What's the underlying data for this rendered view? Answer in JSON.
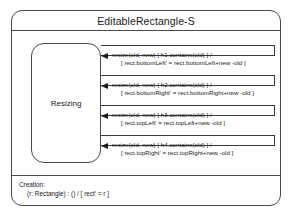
{
  "diagram": {
    "title": "EditableRectangle-S",
    "state": {
      "name": "Resizing"
    },
    "transitions": [
      {
        "trigger": "resize(old, new) [ h1.contains(old) ] /",
        "effect": "[ rect.bottomLeft' = rect.bottomLeft+new -old ]"
      },
      {
        "trigger": "resize(old, new) [ h2.contains(old) ] /",
        "effect": "[ rect.bottomRight' = rect.bottomRight+new -old ]"
      },
      {
        "trigger": "resize(old, new) [ h3.contains(old) ] /",
        "effect": "[ rect.topLeft' = rect.topLeft+new -old ]"
      },
      {
        "trigger": "resize(old, new) [ h4.contains(old) ] /",
        "effect": "[ rect.topRight' = rect.topRight+new -old ]"
      }
    ],
    "creation": {
      "heading": "Creation:",
      "signature": "(r: Rectangle) : () / [ rect' = r ]"
    },
    "colors": {
      "stroke": "#4a4a4a",
      "text": "#1a1a1a",
      "background": "#ffffff"
    }
  }
}
